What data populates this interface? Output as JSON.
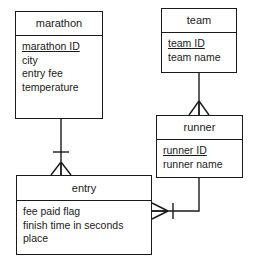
{
  "diagram": {
    "notation": "crow's foot",
    "stroke_color": "#1a1a1a",
    "background_color": "#ffffff"
  },
  "entities": [
    {
      "id": "marathon",
      "name": "marathon",
      "attributes": [
        {
          "label": "marathon ID",
          "key": true
        },
        {
          "label": "city",
          "key": false
        },
        {
          "label": "entry fee",
          "key": false
        },
        {
          "label": "temperature",
          "key": false
        }
      ]
    },
    {
      "id": "team",
      "name": "team",
      "attributes": [
        {
          "label": "team ID",
          "key": true
        },
        {
          "label": "team name",
          "key": false
        }
      ]
    },
    {
      "id": "runner",
      "name": "runner",
      "attributes": [
        {
          "label": "runner ID",
          "key": true
        },
        {
          "label": "runner name",
          "key": false
        }
      ]
    },
    {
      "id": "entry",
      "name": "entry",
      "attributes": [
        {
          "label": "fee paid flag",
          "key": false
        },
        {
          "label": "finish time in seconds",
          "key": false
        },
        {
          "label": "place",
          "key": false
        }
      ]
    }
  ],
  "relationships": [
    {
      "id": "marathon-entry",
      "from": "marathon",
      "to": "entry",
      "from_cardinality": "one",
      "to_cardinality": "many"
    },
    {
      "id": "team-runner",
      "from": "team",
      "to": "runner",
      "from_cardinality": "one",
      "to_cardinality": "many"
    },
    {
      "id": "runner-entry",
      "from": "runner",
      "to": "entry",
      "from_cardinality": "one",
      "to_cardinality": "many"
    }
  ]
}
